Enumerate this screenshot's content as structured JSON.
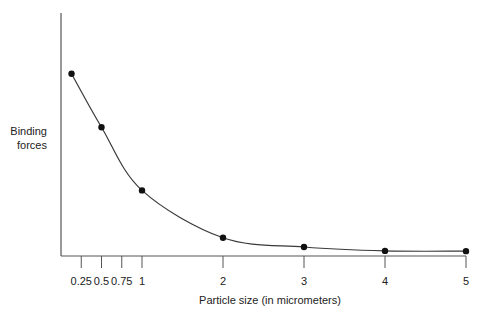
{
  "chart_data": {
    "type": "line",
    "title": "",
    "xlabel": "Particle size (in micrometers)",
    "ylabel_lines": [
      "Binding",
      "forces"
    ],
    "ylabel": "Binding forces",
    "x_ticks": [
      {
        "value": 0.25,
        "label": "0.25"
      },
      {
        "value": 0.5,
        "label": "0.5"
      },
      {
        "value": 0.75,
        "label": "0.75"
      },
      {
        "value": 1,
        "label": "1"
      },
      {
        "value": 2,
        "label": "2"
      },
      {
        "value": 3,
        "label": "3"
      },
      {
        "value": 4,
        "label": "4"
      },
      {
        "value": 5,
        "label": "5"
      }
    ],
    "y_ticks": [],
    "xlim": [
      0,
      5
    ],
    "ylim": [
      0,
      100
    ],
    "grid": false,
    "legend": null,
    "series": [
      {
        "name": "Binding forces",
        "x": [
          0.13,
          0.5,
          1,
          2,
          3,
          4,
          5
        ],
        "values": [
          75,
          53,
          27,
          7.5,
          3.7,
          2.1,
          2.0
        ],
        "markers": true,
        "smooth": true
      }
    ]
  },
  "colors": {
    "line": "#3a3a3a",
    "marker": "#111111",
    "axis": "#555555",
    "text": "#222222"
  }
}
